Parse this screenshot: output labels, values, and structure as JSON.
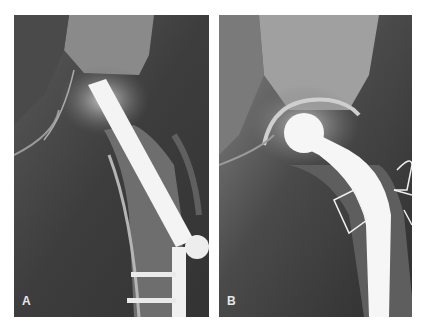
{
  "figure": {
    "panels": [
      {
        "label": "A",
        "description": "Radiograph of hip with sliding hip screw and side plate fixation of proximal femur",
        "implant": "lag screw with side plate and cortical screws"
      },
      {
        "label": "B",
        "description": "Radiograph of hip with cemented femoral hemiarthroplasty stem and cerclage wires",
        "implant": "femoral head prosthesis with stem and wire loops"
      }
    ],
    "colors": {
      "background": "#ffffff",
      "film_dark": "#3a3a3a",
      "bone": "#9a9a9a",
      "metal": "#f4f4f4"
    }
  }
}
